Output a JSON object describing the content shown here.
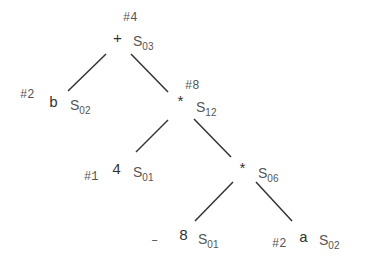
{
  "tree": {
    "nodes": [
      {
        "id": "root",
        "tag": "#4",
        "symbol": "+",
        "state": "S",
        "state_sub": "03"
      },
      {
        "id": "left",
        "tag": "#2",
        "symbol": "b",
        "state": "S",
        "state_sub": "02"
      },
      {
        "id": "mul1",
        "tag": "#8",
        "symbol": "*",
        "state": "S",
        "state_sub": "12"
      },
      {
        "id": "four",
        "tag": "#1",
        "symbol": "4",
        "state": "S",
        "state_sub": "01"
      },
      {
        "id": "mul2",
        "tag": "",
        "symbol": "*",
        "state": "S",
        "state_sub": "06"
      },
      {
        "id": "eight",
        "tag": "–",
        "symbol": "8",
        "state": "S",
        "state_sub": "01"
      },
      {
        "id": "a",
        "tag": "#2",
        "symbol": "a",
        "state": "S",
        "state_sub": "02"
      }
    ],
    "edges": [
      [
        "root",
        "left"
      ],
      [
        "root",
        "mul1"
      ],
      [
        "mul1",
        "four"
      ],
      [
        "mul1",
        "mul2"
      ],
      [
        "mul2",
        "eight"
      ],
      [
        "mul2",
        "a"
      ]
    ],
    "colors": {
      "line": "#333333",
      "text": "#3a3a3a"
    }
  }
}
